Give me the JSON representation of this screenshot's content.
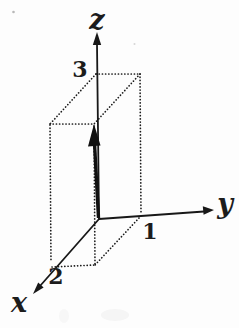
{
  "figure": {
    "background_color": "#fdfdfd",
    "ink_color": "#1c1c1c",
    "axes": {
      "z": {
        "label": "z",
        "tick": "3"
      },
      "y": {
        "label": "y",
        "tick": "1"
      },
      "x": {
        "label": "x",
        "tick": "2"
      }
    }
  }
}
